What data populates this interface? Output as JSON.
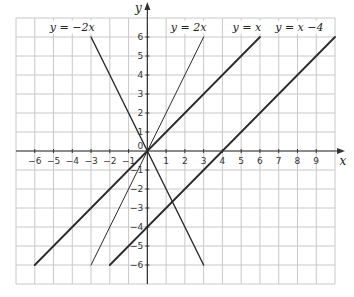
{
  "chart_data": {
    "type": "line",
    "title": "",
    "xlabel": "x",
    "ylabel": "y",
    "xlim": [
      -7,
      10
    ],
    "ylim": [
      -7,
      7
    ],
    "grid": true,
    "x_ticks": [
      -6,
      -5,
      -4,
      -3,
      -2,
      -1,
      0,
      1,
      2,
      3,
      4,
      5,
      6,
      7,
      8,
      9
    ],
    "y_ticks": [
      -6,
      -5,
      -4,
      -3,
      -2,
      -1,
      0,
      1,
      2,
      3,
      4,
      5,
      6
    ],
    "x_tick_labels": [
      "−6",
      "−5",
      "−4",
      "−3",
      "−2",
      "−1",
      "0",
      "1",
      "2",
      "3",
      "4",
      "5",
      "6",
      "7",
      "8",
      "9"
    ],
    "y_tick_labels": [
      "−6",
      "−5",
      "−4",
      "−3",
      "−2",
      "−1",
      "0",
      "1",
      "2",
      "3",
      "4",
      "5",
      "6"
    ],
    "series": [
      {
        "name": "y = −2x",
        "label": "y = −2x",
        "slope": -2,
        "intercept": 0,
        "x": [
          -3,
          3
        ],
        "y": [
          6,
          -6
        ],
        "stroke_width": 1.4,
        "label_pos": [
          -4.0,
          6.55
        ]
      },
      {
        "name": "y = 2x",
        "label": "y = 2x",
        "slope": 2,
        "intercept": 0,
        "x": [
          -3,
          3
        ],
        "y": [
          -6,
          6
        ],
        "stroke_width": 1.0,
        "label_pos": [
          2.2,
          6.55
        ]
      },
      {
        "name": "y = x",
        "label": "y = x",
        "slope": 1,
        "intercept": 0,
        "x": [
          -6,
          6
        ],
        "y": [
          -6,
          6
        ],
        "stroke_width": 1.8,
        "label_pos": [
          5.3,
          6.55
        ]
      },
      {
        "name": "y = x −4",
        "label": "y = x −4",
        "slope": 1,
        "intercept": -4,
        "x": [
          -2,
          10
        ],
        "y": [
          -6,
          6
        ],
        "stroke_width": 1.8,
        "label_pos": [
          8.1,
          6.55
        ]
      }
    ]
  },
  "colors": {
    "grid": "#c8c8c8",
    "axis": "#333333",
    "line": "#2a2a2a"
  }
}
